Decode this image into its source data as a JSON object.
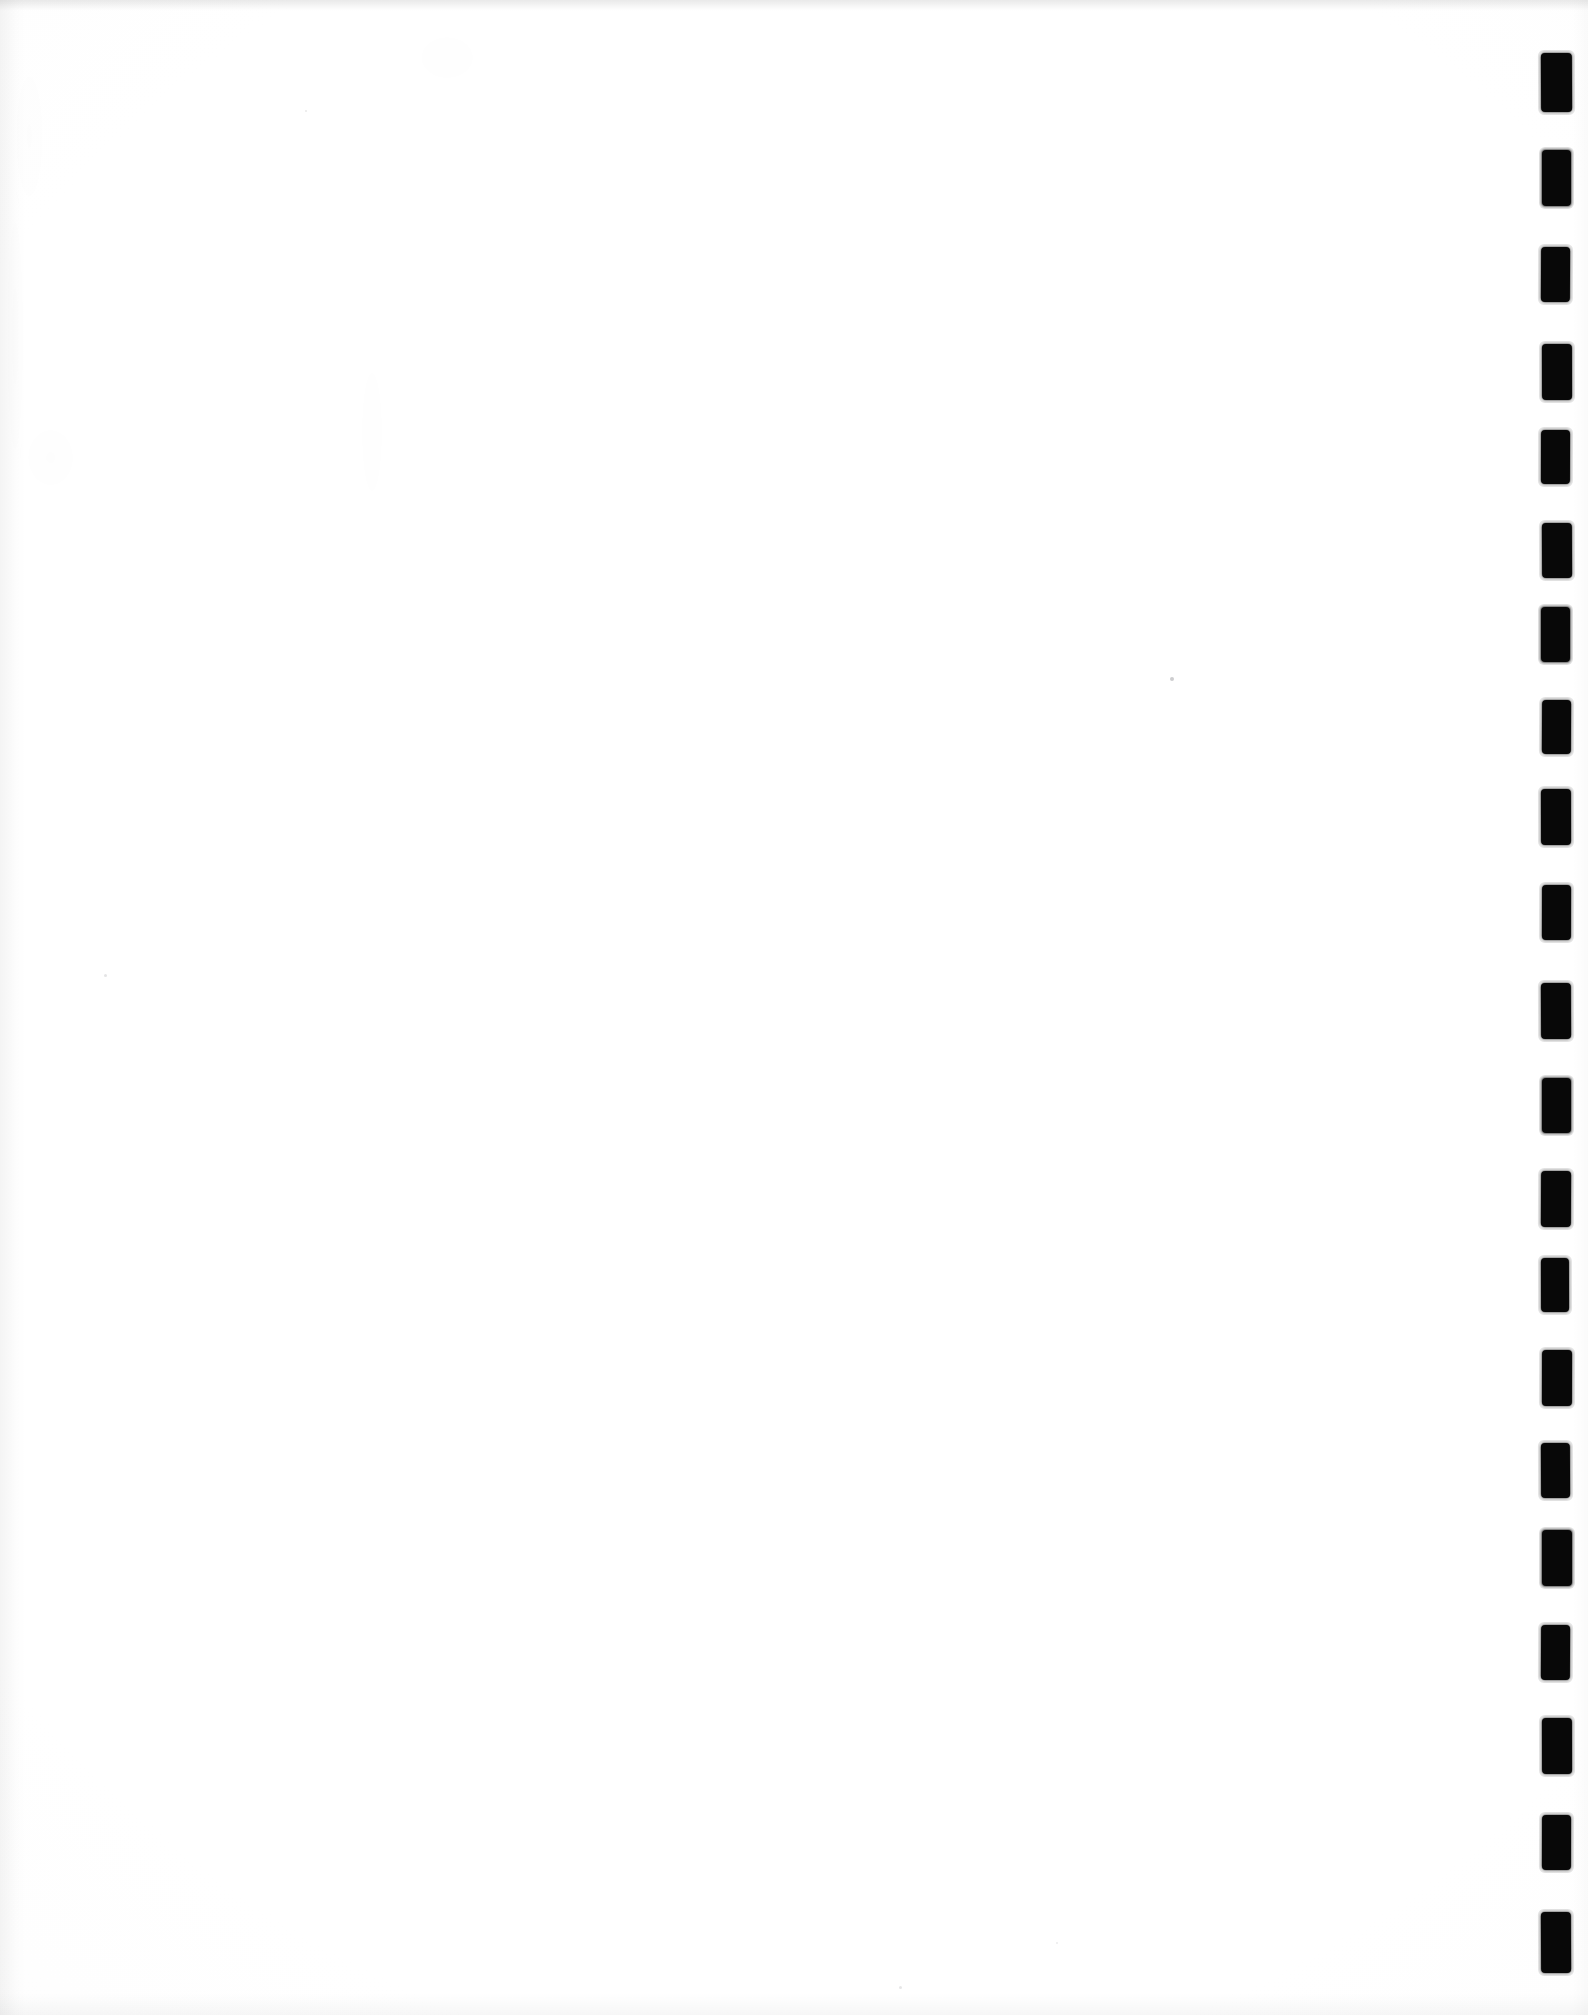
{
  "document": {
    "kind": "scanned-page",
    "page_label": "",
    "body_text": "",
    "note": "blank page",
    "orientation": "portrait",
    "width_px": 1588,
    "height_px": 2015
  },
  "colors": {
    "paper": "#ffffff",
    "paper_shade": "#f7f7f7",
    "mark_ink": "#0a0a0a",
    "speck": "#5a5a5f"
  },
  "binding_marks": {
    "label": "edge index marks",
    "count": 20,
    "left_px": 1541,
    "width_px": 30,
    "height_px": 56,
    "first_top_px": 53,
    "spacing_px": 98,
    "items": [
      {
        "index": 1,
        "top": 53,
        "left": 1541,
        "width": 31,
        "height": 59
      },
      {
        "index": 2,
        "top": 150,
        "left": 1542,
        "width": 29,
        "height": 56
      },
      {
        "index": 3,
        "top": 247,
        "left": 1541,
        "width": 29,
        "height": 55
      },
      {
        "index": 4,
        "top": 344,
        "left": 1542,
        "width": 30,
        "height": 56
      },
      {
        "index": 5,
        "top": 430,
        "left": 1541,
        "width": 29,
        "height": 54
      },
      {
        "index": 6,
        "top": 523,
        "left": 1542,
        "width": 30,
        "height": 55
      },
      {
        "index": 7,
        "top": 607,
        "left": 1541,
        "width": 29,
        "height": 55
      },
      {
        "index": 8,
        "top": 700,
        "left": 1542,
        "width": 29,
        "height": 54
      },
      {
        "index": 9,
        "top": 789,
        "left": 1541,
        "width": 30,
        "height": 56
      },
      {
        "index": 10,
        "top": 885,
        "left": 1542,
        "width": 29,
        "height": 55
      },
      {
        "index": 11,
        "top": 983,
        "left": 1541,
        "width": 30,
        "height": 56
      },
      {
        "index": 12,
        "top": 1078,
        "left": 1542,
        "width": 29,
        "height": 55
      },
      {
        "index": 13,
        "top": 1171,
        "left": 1541,
        "width": 30,
        "height": 56
      },
      {
        "index": 14,
        "top": 1258,
        "left": 1541,
        "width": 28,
        "height": 54
      },
      {
        "index": 15,
        "top": 1350,
        "left": 1542,
        "width": 30,
        "height": 56
      },
      {
        "index": 16,
        "top": 1443,
        "left": 1541,
        "width": 29,
        "height": 55
      },
      {
        "index": 17,
        "top": 1530,
        "left": 1542,
        "width": 30,
        "height": 56
      },
      {
        "index": 18,
        "top": 1625,
        "left": 1541,
        "width": 29,
        "height": 55
      },
      {
        "index": 19,
        "top": 1718,
        "left": 1542,
        "width": 30,
        "height": 56
      },
      {
        "index": 20,
        "top": 1912,
        "left": 1541,
        "width": 30,
        "height": 61
      },
      {
        "index": 21,
        "top": 1815,
        "left": 1542,
        "width": 29,
        "height": 55
      }
    ]
  },
  "specks": {
    "label": "scanner dust specks",
    "items": [
      {
        "left": 1170,
        "top": 677,
        "size": 4,
        "opacity": 0.55
      },
      {
        "left": 104,
        "top": 974,
        "size": 3,
        "opacity": 0.3
      },
      {
        "left": 899,
        "top": 1986,
        "size": 3,
        "opacity": 0.28
      },
      {
        "left": 1056,
        "top": 1942,
        "size": 2,
        "opacity": 0.22
      },
      {
        "left": 305,
        "top": 110,
        "size": 2,
        "opacity": 0.25
      }
    ]
  }
}
